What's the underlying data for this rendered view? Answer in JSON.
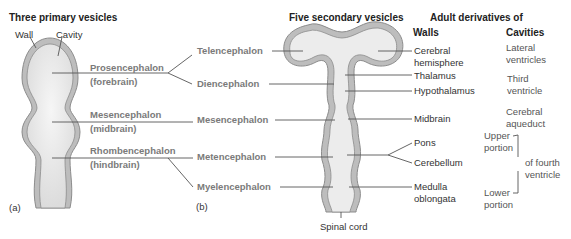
{
  "panel_a": {
    "title": "Three primary vesicles",
    "wall_label": "Wall",
    "cavity_label": "Cavity",
    "letter": "(a)",
    "vesicles": [
      {
        "name": "Prosencephalon",
        "common": "(forebrain)"
      },
      {
        "name": "Mesencephalon",
        "common": "(midbrain)"
      },
      {
        "name": "Rhombencephalon",
        "common": "(hindbrain)"
      }
    ]
  },
  "panel_b": {
    "title": "Five secondary vesicles",
    "letter": "(b)",
    "vesicles": [
      "Telencephalon",
      "Diencephalon",
      "Mesencephalon",
      "Metencephalon",
      "Myelencephalon"
    ],
    "spinal_cord": "Spinal cord"
  },
  "adult": {
    "title": "Adult derivatives of",
    "walls_header": "Walls",
    "cavities_header": "Cavities",
    "walls": {
      "cerebral_1": "Cerebral",
      "cerebral_2": "hemisphere",
      "thalamus": "Thalamus",
      "hypothalamus": "Hypothalamus",
      "midbrain": "Midbrain",
      "pons": "Pons",
      "cerebellum": "Cerebellum",
      "medulla_1": "Medulla",
      "medulla_2": "oblongata"
    },
    "cavities": {
      "lateral_1": "Lateral",
      "lateral_2": "ventricles",
      "third_1": "Third",
      "third_2": "ventricle",
      "aqueduct_1": "Cerebral",
      "aqueduct_2": "aqueduct",
      "upper_1": "Upper",
      "upper_2": "portion",
      "lower_1": "Lower",
      "lower_2": "portion",
      "fourth_1": "of fourth",
      "fourth_2": "ventricle"
    }
  },
  "colors": {
    "wall_outer": "#8c8c8c",
    "wall_fill": "#bdbdbd",
    "cavity": "#ececec",
    "line": "#555555",
    "grey_text": "#7a7a7a"
  }
}
